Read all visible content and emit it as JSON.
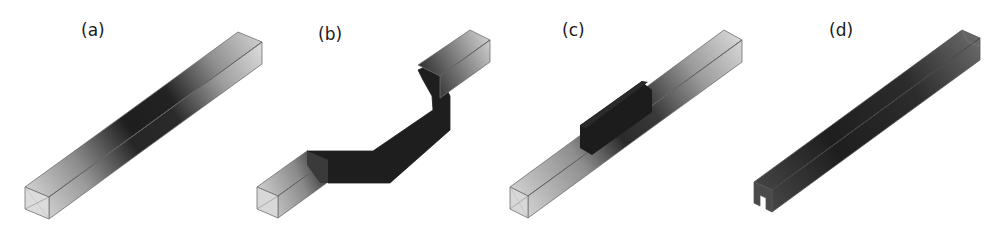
{
  "figure": {
    "panels": [
      {
        "id": "a",
        "label": "(a)",
        "description": "straight square hollow beam, dark shading concentrated in middle span"
      },
      {
        "id": "b",
        "label": "(b)",
        "description": "bent (zig-zag) square beam, dark shading along central bent portion"
      },
      {
        "id": "c",
        "label": "(c)",
        "description": "straight square beam with thickened dark middle segment"
      },
      {
        "id": "d",
        "label": "(d)",
        "description": "open-section (channel) beam, dark shading across whole length"
      }
    ],
    "colors": {
      "background": "#ffffff",
      "light_shade": "#d8d8d8",
      "dark_shade": "#1c1c1c",
      "edge": "#6e6e6e",
      "label": "#1a1a1a"
    }
  }
}
